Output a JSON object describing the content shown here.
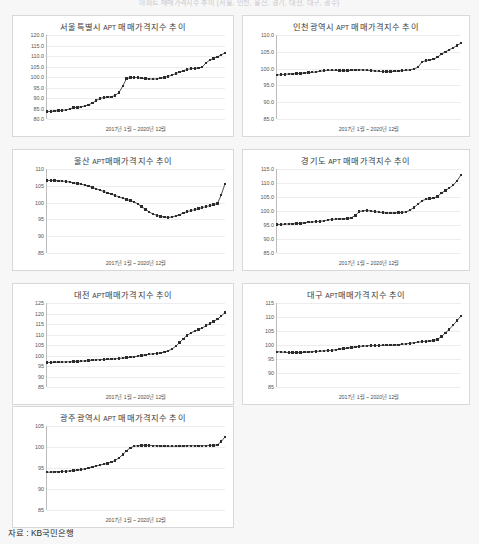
{
  "document": {
    "heading": "아파트 매매가격지수 추이 (서울, 인천, 울산, 경기, 대전, 대구, 광주)",
    "source_label": "자료 : KB국민은행"
  },
  "common": {
    "x_caption": "2017년 1월 ~ 2020년 12월",
    "apt_token": "APT",
    "line_color": "#3d3d3d",
    "marker_color": "#2b2b2b",
    "grid_color": "#ededed",
    "panel_border_color": "#d8d8d8",
    "page_background": "#f7f7f7",
    "panel_background": "#ffffff"
  },
  "chart_data": [
    {
      "id": "seoul",
      "type": "line",
      "title": "서울특별시 APT 매매가격지수 추이",
      "title_prefix": "서울특별시 ",
      "title_suffix": " 매매가격지수 추이",
      "xlabel": "2017년 1월 ~ 2020년 12월",
      "ylabel": "",
      "ylim": [
        80.0,
        120.0
      ],
      "yticks": [
        120.0,
        115.0,
        110.0,
        105.0,
        100.0,
        95.0,
        90.0,
        85.0,
        80.0
      ],
      "ytick_labels": [
        "120.0",
        "115.0",
        "110.0",
        "105.0",
        "100.0",
        "95.0",
        "90.0",
        "85.0",
        "80.0"
      ],
      "grid": true,
      "x": [
        "2017-01",
        "2017-02",
        "2017-03",
        "2017-04",
        "2017-05",
        "2017-06",
        "2017-07",
        "2017-08",
        "2017-09",
        "2017-10",
        "2017-11",
        "2017-12",
        "2018-01",
        "2018-02",
        "2018-03",
        "2018-04",
        "2018-05",
        "2018-06",
        "2018-07",
        "2018-08",
        "2018-09",
        "2018-10",
        "2018-11",
        "2018-12",
        "2019-01",
        "2019-02",
        "2019-03",
        "2019-04",
        "2019-05",
        "2019-06",
        "2019-07",
        "2019-08",
        "2019-09",
        "2019-10",
        "2019-11",
        "2019-12",
        "2020-01",
        "2020-02",
        "2020-03",
        "2020-04",
        "2020-05",
        "2020-06",
        "2020-07",
        "2020-08",
        "2020-09",
        "2020-10",
        "2020-11",
        "2020-12"
      ],
      "values": [
        83.5,
        83.6,
        83.8,
        84.0,
        84.1,
        84.3,
        84.8,
        85.4,
        85.5,
        85.8,
        86.2,
        86.8,
        87.6,
        88.8,
        89.8,
        90.2,
        90.4,
        90.6,
        91.2,
        92.6,
        95.6,
        99.3,
        99.7,
        99.8,
        99.7,
        99.4,
        99.2,
        99.1,
        99.0,
        99.1,
        99.4,
        99.8,
        100.3,
        100.9,
        101.6,
        102.3,
        103.0,
        103.6,
        104.0,
        104.1,
        104.2,
        104.8,
        106.8,
        108.0,
        108.9,
        109.6,
        110.5,
        111.5
      ]
    },
    {
      "id": "incheon",
      "type": "line",
      "title": "인천광역시 APT 매매가격지수 추이",
      "title_prefix": "인천광역시 ",
      "title_suffix": " 매매가격지수 추이",
      "xlabel": "2017년 1월 ~ 2020년 12월",
      "ylabel": "",
      "ylim": [
        85.0,
        110.0
      ],
      "yticks": [
        110.0,
        105.0,
        100.0,
        95.0,
        90.0,
        85.0
      ],
      "ytick_labels": [
        "110.0",
        "105.0",
        "100.0",
        "95.0",
        "90.0",
        "85.0"
      ],
      "grid": true,
      "x": [
        "2017-01",
        "2017-02",
        "2017-03",
        "2017-04",
        "2017-05",
        "2017-06",
        "2017-07",
        "2017-08",
        "2017-09",
        "2017-10",
        "2017-11",
        "2017-12",
        "2018-01",
        "2018-02",
        "2018-03",
        "2018-04",
        "2018-05",
        "2018-06",
        "2018-07",
        "2018-08",
        "2018-09",
        "2018-10",
        "2018-11",
        "2018-12",
        "2019-01",
        "2019-02",
        "2019-03",
        "2019-04",
        "2019-05",
        "2019-06",
        "2019-07",
        "2019-08",
        "2019-09",
        "2019-10",
        "2019-11",
        "2019-12",
        "2020-01",
        "2020-02",
        "2020-03",
        "2020-04",
        "2020-05",
        "2020-06",
        "2020-07",
        "2020-08",
        "2020-09",
        "2020-10",
        "2020-11",
        "2020-12"
      ],
      "values": [
        98.1,
        98.2,
        98.3,
        98.4,
        98.4,
        98.5,
        98.6,
        98.7,
        98.8,
        98.9,
        99.0,
        99.2,
        99.4,
        99.5,
        99.5,
        99.5,
        99.4,
        99.4,
        99.4,
        99.5,
        99.6,
        99.6,
        99.6,
        99.5,
        99.4,
        99.3,
        99.2,
        99.1,
        99.1,
        99.1,
        99.2,
        99.3,
        99.4,
        99.5,
        99.6,
        99.9,
        100.4,
        101.9,
        102.4,
        102.6,
        102.8,
        103.4,
        104.3,
        105.0,
        105.6,
        106.2,
        106.9,
        107.6
      ]
    },
    {
      "id": "ulsan",
      "type": "line",
      "title": "울산 APT매매가격지수 추이",
      "title_prefix": "울산 ",
      "title_suffix": "매매가격지수 추이",
      "xlabel": "2017년 1월 ~ 2020년 12월",
      "ylabel": "",
      "ylim": [
        85,
        110
      ],
      "yticks": [
        110,
        105,
        100,
        95,
        90,
        85
      ],
      "ytick_labels": [
        "110",
        "105",
        "100",
        "95",
        "90",
        "85"
      ],
      "grid": true,
      "x": [
        "2017-01",
        "2017-02",
        "2017-03",
        "2017-04",
        "2017-05",
        "2017-06",
        "2017-07",
        "2017-08",
        "2017-09",
        "2017-10",
        "2017-11",
        "2017-12",
        "2018-01",
        "2018-02",
        "2018-03",
        "2018-04",
        "2018-05",
        "2018-06",
        "2018-07",
        "2018-08",
        "2018-09",
        "2018-10",
        "2018-11",
        "2018-12",
        "2019-01",
        "2019-02",
        "2019-03",
        "2019-04",
        "2019-05",
        "2019-06",
        "2019-07",
        "2019-08",
        "2019-09",
        "2019-10",
        "2019-11",
        "2019-12",
        "2020-01",
        "2020-02",
        "2020-03",
        "2020-04",
        "2020-05",
        "2020-06",
        "2020-07",
        "2020-08",
        "2020-09",
        "2020-10",
        "2020-11",
        "2020-12"
      ],
      "values": [
        106.6,
        106.6,
        106.6,
        106.5,
        106.4,
        106.3,
        106.1,
        105.9,
        105.7,
        105.5,
        105.2,
        104.9,
        104.5,
        104.1,
        103.7,
        103.3,
        102.9,
        102.5,
        102.1,
        101.7,
        101.3,
        100.9,
        100.6,
        100.2,
        99.6,
        98.8,
        98.0,
        97.2,
        96.6,
        96.2,
        95.9,
        95.7,
        95.6,
        95.7,
        96.0,
        96.4,
        96.9,
        97.3,
        97.6,
        97.9,
        98.2,
        98.5,
        98.8,
        99.1,
        99.4,
        99.7,
        102.3,
        105.6
      ]
    },
    {
      "id": "gyeonggi",
      "type": "line",
      "title": "경기도 APT 매매가격지수 추이",
      "title_prefix": "경기도 ",
      "title_suffix": " 매매가격지수 추이",
      "xlabel": "2017년 1월 ~ 2020년 12월",
      "ylabel": "",
      "ylim": [
        85.0,
        115.0
      ],
      "yticks": [
        115.0,
        110.0,
        105.0,
        100.0,
        95.0,
        90.0,
        85.0
      ],
      "ytick_labels": [
        "115.0",
        "110.0",
        "105.0",
        "100.0",
        "95.0",
        "90.0",
        "85.0"
      ],
      "grid": true,
      "x": [
        "2017-01",
        "2017-02",
        "2017-03",
        "2017-04",
        "2017-05",
        "2017-06",
        "2017-07",
        "2017-08",
        "2017-09",
        "2017-10",
        "2017-11",
        "2017-12",
        "2018-01",
        "2018-02",
        "2018-03",
        "2018-04",
        "2018-05",
        "2018-06",
        "2018-07",
        "2018-08",
        "2018-09",
        "2018-10",
        "2018-11",
        "2018-12",
        "2019-01",
        "2019-02",
        "2019-03",
        "2019-04",
        "2019-05",
        "2019-06",
        "2019-07",
        "2019-08",
        "2019-09",
        "2019-10",
        "2019-11",
        "2019-12",
        "2020-01",
        "2020-02",
        "2020-03",
        "2020-04",
        "2020-05",
        "2020-06",
        "2020-07",
        "2020-08",
        "2020-09",
        "2020-10",
        "2020-11",
        "2020-12"
      ],
      "values": [
        95.2,
        95.2,
        95.3,
        95.4,
        95.4,
        95.5,
        95.6,
        95.8,
        96.0,
        96.1,
        96.2,
        96.3,
        96.5,
        96.8,
        97.0,
        97.1,
        97.2,
        97.2,
        97.3,
        97.6,
        98.4,
        99.8,
        100.1,
        100.2,
        100.0,
        99.8,
        99.6,
        99.4,
        99.3,
        99.2,
        99.3,
        99.4,
        99.5,
        99.7,
        100.3,
        101.3,
        102.4,
        103.6,
        104.2,
        104.4,
        104.6,
        105.2,
        106.4,
        107.3,
        108.2,
        109.2,
        110.8,
        112.9
      ]
    },
    {
      "id": "daejeon",
      "type": "line",
      "title": "대전 APT매매가격지수 추이",
      "title_prefix": "대전 ",
      "title_suffix": "매매가격지수 추이",
      "xlabel": "2017년 1월 ~ 2020년 12월",
      "ylabel": "",
      "ylim": [
        85,
        125
      ],
      "yticks": [
        125,
        120,
        115,
        110,
        105,
        100,
        95,
        90,
        85
      ],
      "ytick_labels": [
        "125",
        "120",
        "115",
        "110",
        "105",
        "100",
        "95",
        "90",
        "85"
      ],
      "grid": true,
      "x": [
        "2017-01",
        "2017-02",
        "2017-03",
        "2017-04",
        "2017-05",
        "2017-06",
        "2017-07",
        "2017-08",
        "2017-09",
        "2017-10",
        "2017-11",
        "2017-12",
        "2018-01",
        "2018-02",
        "2018-03",
        "2018-04",
        "2018-05",
        "2018-06",
        "2018-07",
        "2018-08",
        "2018-09",
        "2018-10",
        "2018-11",
        "2018-12",
        "2019-01",
        "2019-02",
        "2019-03",
        "2019-04",
        "2019-05",
        "2019-06",
        "2019-07",
        "2019-08",
        "2019-09",
        "2019-10",
        "2019-11",
        "2019-12",
        "2020-01",
        "2020-02",
        "2020-03",
        "2020-04",
        "2020-05",
        "2020-06",
        "2020-07",
        "2020-08",
        "2020-09",
        "2020-10",
        "2020-11",
        "2020-12"
      ],
      "values": [
        96.7,
        96.7,
        96.8,
        96.8,
        96.9,
        96.9,
        97.0,
        97.1,
        97.2,
        97.3,
        97.4,
        97.6,
        97.8,
        97.9,
        98.0,
        98.1,
        98.2,
        98.3,
        98.4,
        98.6,
        98.8,
        99.0,
        99.2,
        99.4,
        99.7,
        100.0,
        100.3,
        100.6,
        100.8,
        101.0,
        101.2,
        101.6,
        102.2,
        103.1,
        104.4,
        106.2,
        108.0,
        109.6,
        110.8,
        111.6,
        112.3,
        113.1,
        114.2,
        115.2,
        116.2,
        117.3,
        118.7,
        120.5
      ]
    },
    {
      "id": "daegu",
      "type": "line",
      "title": "대구 APT매매가격지수 추이",
      "title_prefix": "대구 ",
      "title_suffix": "매매가격지수 추이",
      "xlabel": "2017년 1월 ~ 2020년 12월",
      "ylabel": "",
      "ylim": [
        85,
        115
      ],
      "yticks": [
        115,
        110,
        105,
        100,
        95,
        90,
        85
      ],
      "ytick_labels": [
        "115",
        "110",
        "105",
        "100",
        "95",
        "90",
        "85"
      ],
      "grid": true,
      "x": [
        "2017-01",
        "2017-02",
        "2017-03",
        "2017-04",
        "2017-05",
        "2017-06",
        "2017-07",
        "2017-08",
        "2017-09",
        "2017-10",
        "2017-11",
        "2017-12",
        "2018-01",
        "2018-02",
        "2018-03",
        "2018-04",
        "2018-05",
        "2018-06",
        "2018-07",
        "2018-08",
        "2018-09",
        "2018-10",
        "2018-11",
        "2018-12",
        "2019-01",
        "2019-02",
        "2019-03",
        "2019-04",
        "2019-05",
        "2019-06",
        "2019-07",
        "2019-08",
        "2019-09",
        "2019-10",
        "2019-11",
        "2019-12",
        "2020-01",
        "2020-02",
        "2020-03",
        "2020-04",
        "2020-05",
        "2020-06",
        "2020-07",
        "2020-08",
        "2020-09",
        "2020-10",
        "2020-11",
        "2020-12"
      ],
      "values": [
        97.6,
        97.5,
        97.4,
        97.3,
        97.3,
        97.3,
        97.3,
        97.4,
        97.5,
        97.6,
        97.7,
        97.8,
        97.9,
        98.0,
        98.1,
        98.3,
        98.5,
        98.7,
        98.9,
        99.1,
        99.3,
        99.5,
        99.6,
        99.7,
        99.8,
        99.8,
        99.8,
        99.9,
        99.9,
        99.9,
        100.0,
        100.1,
        100.3,
        100.4,
        100.6,
        100.8,
        101.0,
        101.2,
        101.3,
        101.4,
        101.6,
        102.0,
        103.0,
        104.3,
        105.6,
        107.1,
        108.7,
        110.4
      ]
    },
    {
      "id": "gwangju",
      "type": "line",
      "title": "광주광역시 APT 매매가격지수 추이",
      "title_prefix": "광주광역시 ",
      "title_suffix": " 매매가격지수 추이",
      "xlabel": "2017년 1월 ~ 2020년 12월",
      "ylabel": "",
      "ylim": [
        85,
        105
      ],
      "yticks": [
        105,
        100,
        95,
        90,
        85
      ],
      "ytick_labels": [
        "105",
        "100",
        "95",
        "90",
        "85"
      ],
      "grid": true,
      "x": [
        "2017-01",
        "2017-02",
        "2017-03",
        "2017-04",
        "2017-05",
        "2017-06",
        "2017-07",
        "2017-08",
        "2017-09",
        "2017-10",
        "2017-11",
        "2017-12",
        "2018-01",
        "2018-02",
        "2018-03",
        "2018-04",
        "2018-05",
        "2018-06",
        "2018-07",
        "2018-08",
        "2018-09",
        "2018-10",
        "2018-11",
        "2018-12",
        "2019-01",
        "2019-02",
        "2019-03",
        "2019-04",
        "2019-05",
        "2019-06",
        "2019-07",
        "2019-08",
        "2019-09",
        "2019-10",
        "2019-11",
        "2019-12",
        "2020-01",
        "2020-02",
        "2020-03",
        "2020-04",
        "2020-05",
        "2020-06",
        "2020-07",
        "2020-08",
        "2020-09",
        "2020-10",
        "2020-11",
        "2020-12"
      ],
      "values": [
        94.0,
        94.0,
        94.1,
        94.1,
        94.2,
        94.2,
        94.3,
        94.4,
        94.5,
        94.6,
        94.8,
        95.0,
        95.3,
        95.5,
        95.7,
        95.9,
        96.1,
        96.4,
        96.8,
        97.4,
        98.2,
        99.1,
        99.8,
        100.2,
        100.3,
        100.4,
        100.4,
        100.4,
        100.3,
        100.3,
        100.2,
        100.2,
        100.2,
        100.2,
        100.2,
        100.2,
        100.2,
        100.3,
        100.3,
        100.3,
        100.3,
        100.3,
        100.3,
        100.4,
        100.4,
        100.5,
        101.3,
        102.4
      ]
    }
  ],
  "panels": [
    {
      "id": "seoul",
      "left": 12,
      "top": 15,
      "width": 222,
      "height": 122
    },
    {
      "id": "incheon",
      "left": 242,
      "top": 15,
      "width": 228,
      "height": 122
    },
    {
      "id": "ulsan",
      "left": 12,
      "top": 149,
      "width": 222,
      "height": 122
    },
    {
      "id": "gyeonggi",
      "left": 242,
      "top": 149,
      "width": 228,
      "height": 122
    },
    {
      "id": "daejeon",
      "left": 12,
      "top": 283,
      "width": 222,
      "height": 122
    },
    {
      "id": "daegu",
      "left": 242,
      "top": 283,
      "width": 228,
      "height": 122
    },
    {
      "id": "gwangju",
      "left": 12,
      "top": 406,
      "width": 222,
      "height": 122
    }
  ]
}
